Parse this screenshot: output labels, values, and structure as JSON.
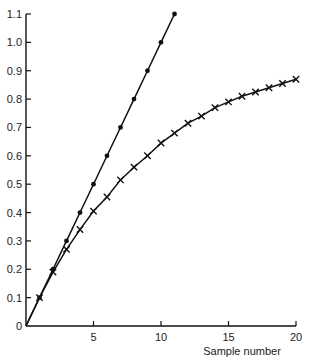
{
  "chart_data": {
    "type": "line",
    "title": "",
    "xlabel": "Sample number",
    "ylabel": "",
    "xlim": [
      0,
      20
    ],
    "ylim": [
      0,
      1.1
    ],
    "grid": false,
    "legend": null,
    "x_ticks": [
      "5",
      "10",
      "15",
      "20"
    ],
    "y_ticks": [
      "0",
      "0.1",
      "0.2",
      "0.3",
      "0.4",
      "0.5",
      "0.6",
      "0.7",
      "0.8",
      "0.9",
      "1.0",
      "1.1"
    ],
    "series": [
      {
        "name": "dots",
        "marker": "dot",
        "line": "solid",
        "x": [
          0,
          1,
          2,
          3,
          4,
          5,
          6,
          7,
          8,
          9,
          10,
          11
        ],
        "values": [
          0,
          0.1,
          0.2,
          0.3,
          0.4,
          0.5,
          0.6,
          0.7,
          0.8,
          0.9,
          1.0,
          1.1
        ]
      },
      {
        "name": "crosses",
        "marker": "x",
        "line": "solid",
        "x": [
          0,
          1,
          2,
          3,
          4,
          5,
          6,
          7,
          8,
          9,
          10,
          11,
          12,
          13,
          14,
          15,
          16,
          17,
          18,
          19,
          20
        ],
        "values": [
          0,
          0.1,
          0.19,
          0.27,
          0.34,
          0.405,
          0.455,
          0.515,
          0.56,
          0.6,
          0.645,
          0.68,
          0.715,
          0.74,
          0.77,
          0.79,
          0.81,
          0.825,
          0.84,
          0.855,
          0.87
        ]
      }
    ]
  },
  "colors": {
    "ink": "#111111",
    "background": "#ffffff"
  }
}
